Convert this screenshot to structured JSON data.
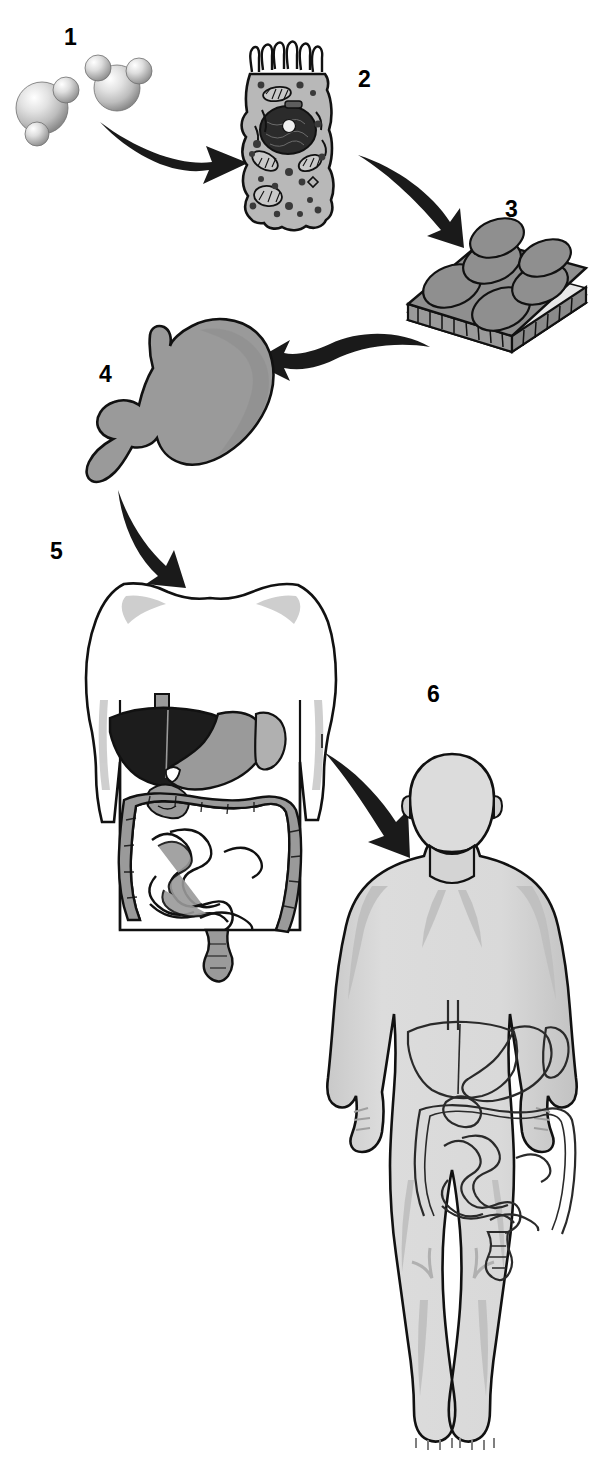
{
  "figure": {
    "background_color": "#ffffff",
    "width": 599,
    "height": 1484
  },
  "palette": {
    "outline": "#111111",
    "arrow_fill": "#1a1a1a",
    "organ_gray": "#9a9a9a",
    "tissue_gray": "#8f8f8f",
    "body_gray": "#d8d8d8",
    "body_shade": "#bdbdbd",
    "liver_dark": "#1c1c1c",
    "molecule_light": "#cfcfcf",
    "cell_gray": "#b8b8b8",
    "nucleus_dark": "#2b2b2b",
    "white": "#ffffff"
  },
  "steps": [
    {
      "number": "1",
      "name": "molecules",
      "caption_label": "1",
      "description": "Two ball-and-stick space-filling molecules, one large sphere with two smaller attached spheres and one water-like molecule",
      "icon": "molecules-icon"
    },
    {
      "number": "2",
      "name": "cell",
      "caption_label": "2",
      "description": "Columnar epithelial cell with microvilli, nucleus, mitochondria, Golgi and vesicles",
      "icon": "cell-icon"
    },
    {
      "number": "3",
      "name": "tissue",
      "caption_label": "3",
      "description": "Block of epithelial tissue showing a sheet of dome-shaped cells over layered basement membrane",
      "icon": "tissue-icon"
    },
    {
      "number": "4",
      "name": "organ",
      "caption_label": "4",
      "description": "Stomach organ with duodenum",
      "icon": "stomach-icon"
    },
    {
      "number": "5",
      "name": "organ-system",
      "caption_label": "5",
      "description": "Torso outline containing the digestive system: liver, stomach, spleen, small intestine and large intestine",
      "icon": "digestive-system-icon"
    },
    {
      "number": "6",
      "name": "organism",
      "caption_label": "6",
      "description": "Whole human body with digestive system visible inside the abdomen",
      "icon": "human-body-icon"
    }
  ],
  "arrows": [
    {
      "name": "arrow-molecules-to-cell",
      "from": "1",
      "to": "2",
      "direction": "right"
    },
    {
      "name": "arrow-cell-to-tissue",
      "from": "2",
      "to": "3",
      "direction": "down-right"
    },
    {
      "name": "arrow-tissue-to-organ",
      "from": "3",
      "to": "4",
      "direction": "left"
    },
    {
      "name": "arrow-organ-to-system",
      "from": "4",
      "to": "5",
      "direction": "down-right"
    },
    {
      "name": "arrow-system-to-organism",
      "from": "5",
      "to": "6",
      "direction": "down-right"
    }
  ]
}
